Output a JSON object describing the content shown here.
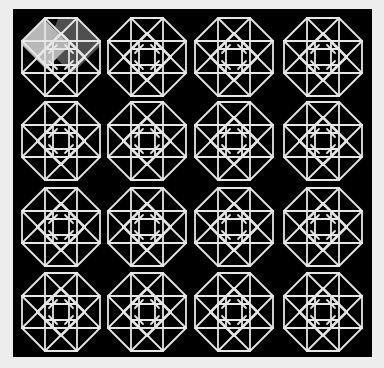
{
  "image": {
    "description": "4x4 grid of octagonal star line patterns on black panel",
    "frame_color": "#ededed",
    "panel_color": "#000000",
    "line_color": "#e6e6e6"
  },
  "grid": {
    "rows": 4,
    "cols": 4,
    "col_centers": [
      61,
      147,
      234,
      323
    ],
    "row_centers": [
      57,
      141,
      227,
      312
    ],
    "half_height": 39,
    "half_edge": 16
  },
  "highlight": {
    "cell": [
      0,
      0
    ],
    "white_polygon": "44,19 70,45 46,69 22,45 22,41",
    "white_opacity": 0.72,
    "gray_polygon": "58,19 77,19 100,42 100,46 72,74 46,48",
    "gray_opacity": 0.45
  }
}
